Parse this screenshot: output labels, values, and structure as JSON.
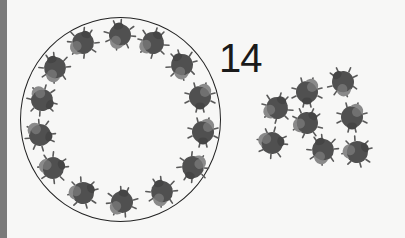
{
  "count_label": "14",
  "colors": {
    "background": "#f7f7f6",
    "left_bar": "#7a7a7a",
    "ring": "#222222",
    "bug_body": "#505050",
    "bug_shell": "#8a8a8a",
    "label": "#1a1a1a"
  },
  "ring": {
    "cx": 121,
    "cy": 120,
    "rx": 100,
    "ry": 102
  },
  "bugs_in_ring": [
    {
      "x": 83,
      "y": 43,
      "r": 20
    },
    {
      "x": 120,
      "y": 35,
      "r": -10
    },
    {
      "x": 153,
      "y": 43,
      "r": 30
    },
    {
      "x": 182,
      "y": 65,
      "r": -30
    },
    {
      "x": 200,
      "y": 97,
      "r": 180
    },
    {
      "x": 203,
      "y": 132,
      "r": 180
    },
    {
      "x": 193,
      "y": 167,
      "r": 200
    },
    {
      "x": 162,
      "y": 192,
      "r": -20
    },
    {
      "x": 122,
      "y": 202,
      "r": 10
    },
    {
      "x": 83,
      "y": 193,
      "r": 60
    },
    {
      "x": 53,
      "y": 168,
      "r": 70
    },
    {
      "x": 40,
      "y": 135,
      "r": 100
    },
    {
      "x": 42,
      "y": 100,
      "r": 120
    },
    {
      "x": 55,
      "y": 68,
      "r": -20
    }
  ],
  "bugs_outside": [
    {
      "x": 307,
      "y": 92,
      "r": 180
    },
    {
      "x": 343,
      "y": 82,
      "r": -40
    },
    {
      "x": 277,
      "y": 108,
      "r": 30
    },
    {
      "x": 307,
      "y": 123,
      "r": 40
    },
    {
      "x": 352,
      "y": 117,
      "r": 180
    },
    {
      "x": 272,
      "y": 143,
      "r": 80
    },
    {
      "x": 323,
      "y": 150,
      "r": -20
    },
    {
      "x": 357,
      "y": 152,
      "r": 60
    }
  ]
}
